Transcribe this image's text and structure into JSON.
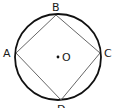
{
  "diagram": {
    "type": "geometry",
    "circle": {
      "cx": 58,
      "cy": 57,
      "r": 43,
      "stroke": "#111111"
    },
    "center": {
      "label": "O",
      "x": 58,
      "y": 56
    },
    "vertices": [
      {
        "label": "A",
        "x": 16,
        "y": 53,
        "label_x": 3,
        "label_y": 57
      },
      {
        "label": "B",
        "x": 56,
        "y": 15,
        "label_x": 52,
        "label_y": 11
      },
      {
        "label": "C",
        "x": 100,
        "y": 53,
        "label_x": 104,
        "label_y": 57
      },
      {
        "label": "D",
        "x": 61,
        "y": 100,
        "label_x": 57,
        "label_y": 113
      }
    ],
    "edges": [
      [
        "A",
        "B"
      ],
      [
        "B",
        "C"
      ],
      [
        "C",
        "D"
      ],
      [
        "D",
        "A"
      ]
    ],
    "line_color": "#555555"
  }
}
